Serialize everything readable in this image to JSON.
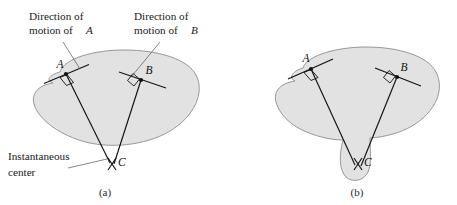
{
  "figure": {
    "title_present": false,
    "background_color": "#ffffff",
    "body_fill_color": "#e2e2e2",
    "body_stroke_color": "#8d8d8d",
    "line_color": "#111111",
    "leader_color": "#555555"
  },
  "annotations": {
    "direction_a_line1": "Direction of",
    "direction_a_line2": "motion of",
    "direction_a_italic": "A",
    "direction_b_line1": "Direction of",
    "direction_b_line2": "motion of",
    "direction_b_italic": "B",
    "instant_center_line1": "Instantaneous",
    "instant_center_line2": "center"
  },
  "panel_a": {
    "caption": "(a)",
    "point_a_label": "A",
    "point_b_label": "B",
    "point_c_label": "C",
    "description": "Rigid body with velocity directions at A and B; perpendiculars meet at instantaneous center C outside the body"
  },
  "panel_b": {
    "caption": "(b)",
    "point_a_label": "A",
    "point_b_label": "B",
    "point_c_label": "C",
    "description": "Rigid body extended with a protrusion so that instantaneous center C lies within the body"
  }
}
